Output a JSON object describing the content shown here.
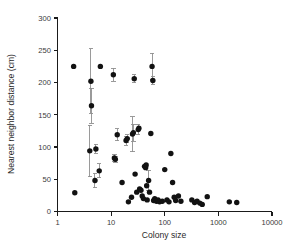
{
  "chart_data": {
    "type": "scatter",
    "title": "",
    "xlabel": "Colony size",
    "ylabel": "Nearest neighbor distance (cm)",
    "xscale": "log",
    "yscale": "linear",
    "xlim": [
      1,
      10000
    ],
    "ylim": [
      0,
      300
    ],
    "xticks": [
      1,
      10,
      100,
      1000,
      10000
    ],
    "xtick_labels": [
      "1",
      "10",
      "100",
      "1000",
      "10000"
    ],
    "yticks": [
      0,
      50,
      100,
      150,
      200,
      250,
      300
    ],
    "ytick_labels": [
      "0",
      "50",
      "100",
      "150",
      "200",
      "250",
      "300"
    ],
    "grid": false,
    "legend": null,
    "marker": "filled-circle",
    "marker_color": "#121212",
    "errorbar_color": "#8f8f8f",
    "errorbar_note": "Vertical error bars shown on a subset of points",
    "points": [
      {
        "x": 2.0,
        "y": 225,
        "yerr": 0
      },
      {
        "x": 2.1,
        "y": 29,
        "yerr": 0
      },
      {
        "x": 4.0,
        "y": 94,
        "yerr": 40
      },
      {
        "x": 4.2,
        "y": 202,
        "yerr": 50
      },
      {
        "x": 4.3,
        "y": 164,
        "yerr": 27
      },
      {
        "x": 5.0,
        "y": 48,
        "yerr": 11
      },
      {
        "x": 5.2,
        "y": 97,
        "yerr": 7
      },
      {
        "x": 6.0,
        "y": 63,
        "yerr": 11
      },
      {
        "x": 6.3,
        "y": 225,
        "yerr": 0
      },
      {
        "x": 11.0,
        "y": 212,
        "yerr": 10
      },
      {
        "x": 11.5,
        "y": 83,
        "yerr": 6
      },
      {
        "x": 12.0,
        "y": 81,
        "yerr": 5
      },
      {
        "x": 13.0,
        "y": 119,
        "yerr": 9
      },
      {
        "x": 16.0,
        "y": 45,
        "yerr": 0
      },
      {
        "x": 19.0,
        "y": 110,
        "yerr": 7
      },
      {
        "x": 20.0,
        "y": 113,
        "yerr": 6
      },
      {
        "x": 21.0,
        "y": 15,
        "yerr": 0
      },
      {
        "x": 24.0,
        "y": 22,
        "yerr": 0
      },
      {
        "x": 25.0,
        "y": 120,
        "yerr": 27
      },
      {
        "x": 26.0,
        "y": 122,
        "yerr": 13
      },
      {
        "x": 27.0,
        "y": 206,
        "yerr": 6
      },
      {
        "x": 28.0,
        "y": 58,
        "yerr": 0
      },
      {
        "x": 30.0,
        "y": 30,
        "yerr": 0
      },
      {
        "x": 32.0,
        "y": 127,
        "yerr": 8
      },
      {
        "x": 33.0,
        "y": 129,
        "yerr": 0
      },
      {
        "x": 34.0,
        "y": 35,
        "yerr": 0
      },
      {
        "x": 36.0,
        "y": 33,
        "yerr": 0
      },
      {
        "x": 38.0,
        "y": 24,
        "yerr": 0
      },
      {
        "x": 40.0,
        "y": 20,
        "yerr": 0
      },
      {
        "x": 42.0,
        "y": 70,
        "yerr": 0
      },
      {
        "x": 44.0,
        "y": 68,
        "yerr": 0
      },
      {
        "x": 45.0,
        "y": 72,
        "yerr": 0
      },
      {
        "x": 46.0,
        "y": 40,
        "yerr": 0
      },
      {
        "x": 47.0,
        "y": 18,
        "yerr": 0
      },
      {
        "x": 50.0,
        "y": 48,
        "yerr": 16
      },
      {
        "x": 52.0,
        "y": 30,
        "yerr": 0
      },
      {
        "x": 55.0,
        "y": 121,
        "yerr": 0
      },
      {
        "x": 58.0,
        "y": 225,
        "yerr": 20
      },
      {
        "x": 60.0,
        "y": 203,
        "yerr": 6
      },
      {
        "x": 62.0,
        "y": 17,
        "yerr": 0
      },
      {
        "x": 65.0,
        "y": 20,
        "yerr": 0
      },
      {
        "x": 70.0,
        "y": 16,
        "yerr": 0
      },
      {
        "x": 75.0,
        "y": 18,
        "yerr": 0
      },
      {
        "x": 80.0,
        "y": 15,
        "yerr": 0
      },
      {
        "x": 90.0,
        "y": 16,
        "yerr": 0
      },
      {
        "x": 100.0,
        "y": 65,
        "yerr": 0
      },
      {
        "x": 110.0,
        "y": 18,
        "yerr": 0
      },
      {
        "x": 120.0,
        "y": 15,
        "yerr": 0
      },
      {
        "x": 130.0,
        "y": 90,
        "yerr": 0
      },
      {
        "x": 140.0,
        "y": 45,
        "yerr": 0
      },
      {
        "x": 150.0,
        "y": 22,
        "yerr": 0
      },
      {
        "x": 160.0,
        "y": 17,
        "yerr": 0
      },
      {
        "x": 180.0,
        "y": 24,
        "yerr": 0
      },
      {
        "x": 200.0,
        "y": 16,
        "yerr": 0
      },
      {
        "x": 320.0,
        "y": 18,
        "yerr": 0
      },
      {
        "x": 360.0,
        "y": 14,
        "yerr": 0
      },
      {
        "x": 400.0,
        "y": 16,
        "yerr": 0
      },
      {
        "x": 450.0,
        "y": 13,
        "yerr": 0
      },
      {
        "x": 500.0,
        "y": 11,
        "yerr": 0
      },
      {
        "x": 620.0,
        "y": 23,
        "yerr": 0
      },
      {
        "x": 1600.0,
        "y": 15,
        "yerr": 0
      },
      {
        "x": 2200.0,
        "y": 14,
        "yerr": 0
      }
    ]
  }
}
